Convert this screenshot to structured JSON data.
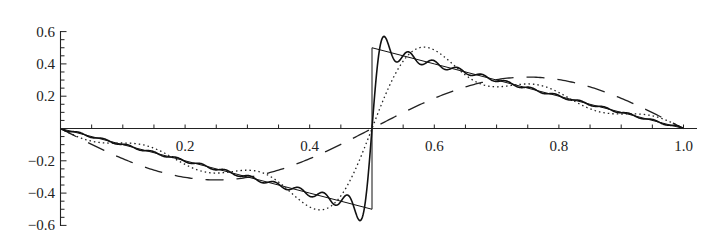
{
  "chart_data": {
    "type": "line",
    "title": "",
    "xlabel": "",
    "ylabel": "",
    "xlim": [
      0,
      1.0
    ],
    "ylim": [
      -0.6,
      0.6
    ],
    "grid": false,
    "legend": null,
    "x_ticks": [
      "0.2",
      "0.4",
      "0.6",
      "0.8",
      "1.0"
    ],
    "x_tick_values": [
      0.2,
      0.4,
      0.6,
      0.8,
      1.0
    ],
    "x_minor_step": 0.05,
    "y_ticks": [
      "0.6",
      "0.4",
      "0.2",
      "−0.2",
      "−0.4",
      "−0.6"
    ],
    "y_tick_values": [
      0.6,
      0.4,
      0.2,
      -0.2,
      -0.4,
      -0.6
    ],
    "y_minor_step": 0.05,
    "series": [
      {
        "name": "sawtooth (exact)",
        "style": "thin-solid",
        "x": [
          0,
          0.1,
          0.2,
          0.3,
          0.4,
          0.5,
          0.5,
          0.6,
          0.7,
          0.8,
          0.9,
          1.0
        ],
        "values": [
          0,
          -0.1,
          -0.2,
          -0.3,
          -0.4,
          -0.5,
          0.5,
          0.4,
          0.3,
          0.2,
          0.1,
          0
        ]
      },
      {
        "name": "Fourier partial sum, many terms",
        "style": "solid",
        "terms": 25,
        "formula": "sum_{n=1}^{N} (-1)^n sin(2 pi n x)/(pi n)",
        "x": [
          0,
          0.1,
          0.2,
          0.3,
          0.4,
          0.48,
          0.49,
          0.5,
          0.51,
          0.52,
          0.6,
          0.7,
          0.8,
          0.9,
          1.0
        ],
        "values": [
          0,
          -0.1,
          -0.2,
          -0.3,
          -0.4,
          -0.48,
          -0.58,
          0,
          0.58,
          0.48,
          0.4,
          0.3,
          0.2,
          0.1,
          0
        ]
      },
      {
        "name": "Fourier partial sum, few terms",
        "style": "dotted",
        "terms": 5,
        "formula": "sum_{n=1}^{N} (-1)^n sin(2 pi n x)/(pi n)",
        "x": [
          0,
          0.1,
          0.2,
          0.3,
          0.35,
          0.4,
          0.45,
          0.5,
          0.55,
          0.6,
          0.65,
          0.7,
          0.8,
          0.9,
          1.0
        ],
        "values": [
          0,
          -0.1,
          -0.19,
          -0.31,
          -0.35,
          -0.38,
          -0.53,
          0,
          0.53,
          0.38,
          0.35,
          0.31,
          0.19,
          0.1,
          0
        ]
      },
      {
        "name": "Fourier partial sum, one term",
        "style": "dashed",
        "terms": 1,
        "formula": "-sin(2 pi x)/pi",
        "x": [
          0,
          0.125,
          0.25,
          0.375,
          0.5,
          0.625,
          0.75,
          0.875,
          1.0
        ],
        "values": [
          0,
          -0.225,
          -0.318,
          -0.225,
          0,
          0.225,
          0.318,
          0.225,
          0
        ]
      }
    ]
  }
}
